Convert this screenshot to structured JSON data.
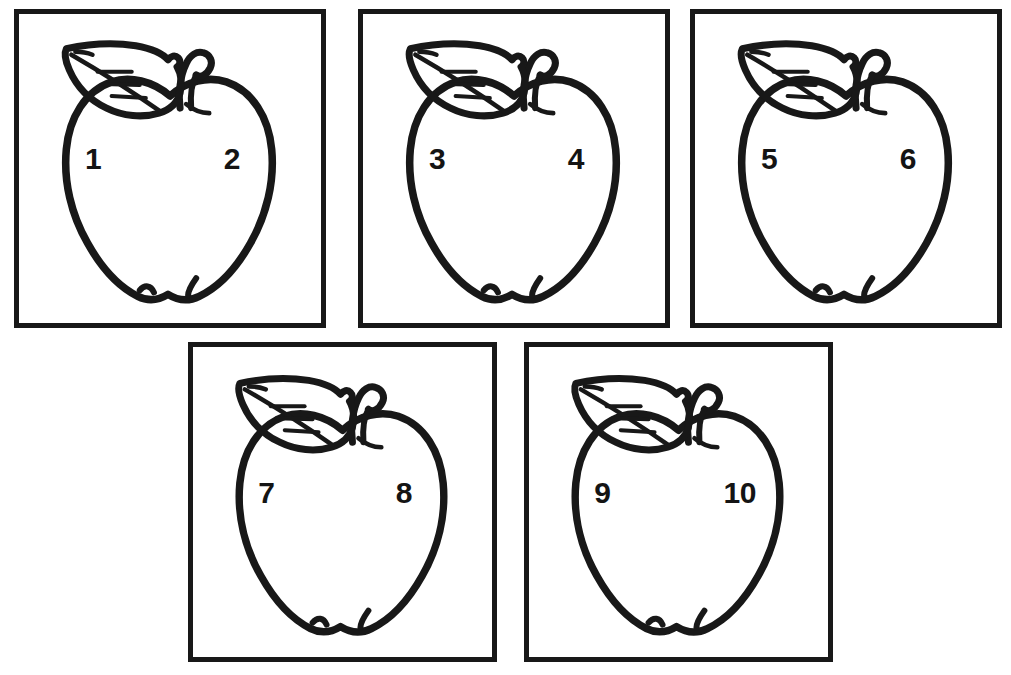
{
  "page": {
    "background_color": "#ffffff",
    "ink_color": "#181818",
    "width": 1011,
    "height": 675
  },
  "artwork": {
    "subject": "apple",
    "style": "black-and-white line drawing / coloring page",
    "parts": [
      "apple-body",
      "leaf",
      "stem",
      "leaf-veins"
    ]
  },
  "cards": [
    {
      "id": "card-1",
      "row": "top",
      "position": {
        "left": 14,
        "top": 9,
        "width": 312,
        "height": 319
      },
      "number_left": "1",
      "number_right": "2",
      "number_size": 30
    },
    {
      "id": "card-2",
      "row": "top",
      "position": {
        "left": 358,
        "top": 9,
        "width": 312,
        "height": 319
      },
      "number_left": "3",
      "number_right": "4",
      "number_size": 30
    },
    {
      "id": "card-3",
      "row": "top",
      "position": {
        "left": 690,
        "top": 9,
        "width": 312,
        "height": 319
      },
      "number_left": "5",
      "number_right": "6",
      "number_size": 30
    },
    {
      "id": "card-4",
      "row": "bottom",
      "position": {
        "left": 188,
        "top": 342,
        "width": 309,
        "height": 320
      },
      "number_left": "7",
      "number_right": "8",
      "number_size": 30
    },
    {
      "id": "card-5",
      "row": "bottom",
      "position": {
        "left": 524,
        "top": 342,
        "width": 309,
        "height": 320
      },
      "number_left": "9",
      "number_right": "10",
      "number_size": 30
    }
  ]
}
